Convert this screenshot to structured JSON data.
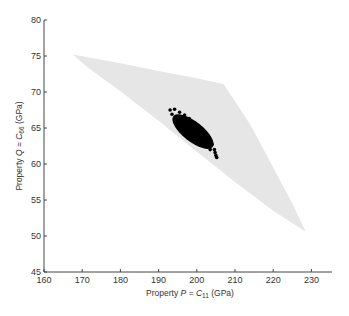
{
  "chart_data": {
    "type": "scatter",
    "title": "",
    "xlabel": "Property P = C11 (GPa)",
    "ylabel": "Property Q = C66 (GPa)",
    "xlabel_parts": {
      "prefix": "Property ",
      "var": "P",
      "eq": " = ",
      "sym": "C",
      "sub": "11",
      "unit": " (GPa)"
    },
    "ylabel_parts": {
      "prefix": "Property ",
      "var": "Q",
      "eq": " = ",
      "sym": "C",
      "sub": "66",
      "unit": " (GPa)"
    },
    "xlim": [
      160,
      235
    ],
    "ylim": [
      45,
      80
    ],
    "xticks": [
      160,
      170,
      180,
      190,
      200,
      210,
      220,
      230
    ],
    "yticks": [
      45,
      50,
      55,
      60,
      65,
      70,
      75,
      80
    ],
    "grid": false,
    "legend": null,
    "feasible_region": {
      "description": "light gray shaded feasible property region",
      "color": "#e8e8e8",
      "vertices": [
        [
          167.5,
          75.2
        ],
        [
          180,
          74.0
        ],
        [
          190,
          72.9
        ],
        [
          200,
          71.9
        ],
        [
          207,
          71.1
        ],
        [
          214,
          65.5
        ],
        [
          220,
          59.5
        ],
        [
          225,
          54.5
        ],
        [
          228.5,
          50.6
        ],
        [
          220,
          53.5
        ],
        [
          210,
          57.5
        ],
        [
          200,
          61.7
        ],
        [
          190,
          66.0
        ],
        [
          180,
          70.1
        ],
        [
          172,
          73.2
        ]
      ]
    },
    "series": [
      {
        "name": "samples",
        "color": "#000000",
        "cluster": {
          "description": "dense elliptical cloud of black points",
          "center": [
            199,
            64.5
          ],
          "x_range": [
            192.5,
            205.5
          ],
          "y_range": [
            61,
            67.6
          ],
          "orientation": "descending (negative correlation)"
        },
        "points": [
          [
            193.0,
            67.5
          ],
          [
            194.2,
            67.6
          ],
          [
            195.5,
            67.2
          ],
          [
            196.8,
            66.8
          ],
          [
            198.0,
            66.3
          ],
          [
            199.5,
            65.7
          ],
          [
            200.8,
            65.0
          ],
          [
            202.0,
            64.2
          ],
          [
            203.2,
            63.4
          ],
          [
            204.0,
            62.7
          ],
          [
            204.6,
            62.0
          ],
          [
            205.0,
            61.2
          ],
          [
            203.5,
            62.0
          ],
          [
            202.5,
            62.5
          ],
          [
            201.0,
            63.0
          ],
          [
            199.8,
            63.6
          ],
          [
            198.5,
            64.2
          ],
          [
            197.0,
            64.9
          ],
          [
            195.8,
            65.5
          ],
          [
            194.5,
            66.2
          ],
          [
            193.5,
            66.9
          ],
          [
            204.8,
            61.6
          ],
          [
            205.2,
            60.9
          ]
        ]
      }
    ]
  }
}
